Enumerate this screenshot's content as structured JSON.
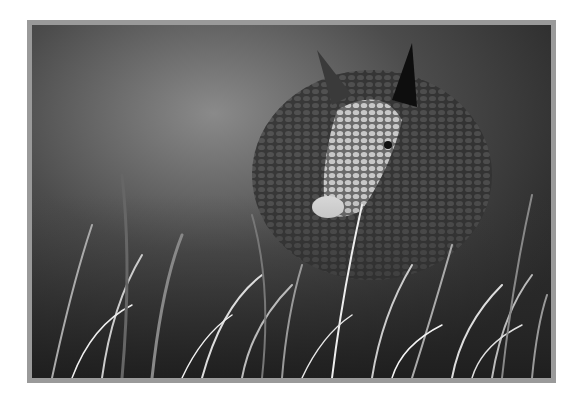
{
  "image": {
    "subject": "armadillo in grass",
    "style": "black-and-white photograph",
    "alt": "Black-and-white photo of an armadillo peeking through tall grass"
  },
  "colors": {
    "frame": "#9a9a9a",
    "background": "#ffffff"
  }
}
